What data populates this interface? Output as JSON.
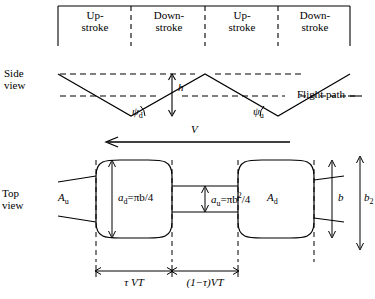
{
  "figure": {
    "phase_labels": [
      {
        "id": "up-stroke-1",
        "line1": "Up-",
        "line2": "stroke"
      },
      {
        "id": "down-stroke-1",
        "line1": "Down-",
        "line2": "stroke"
      },
      {
        "id": "up-stroke-2",
        "line1": "Up-",
        "line2": "stroke"
      },
      {
        "id": "down-stroke-2",
        "line1": "Down-",
        "line2": "stroke"
      }
    ],
    "side_view": {
      "label_line1": "Side",
      "label_line2": "view",
      "height_symbol": "h",
      "flight_path_label": "Flight path",
      "angle_down": "ψ",
      "angle_down_sub": "d",
      "angle_up": "ψ",
      "angle_up_sub": "u",
      "velocity_symbol": "V"
    },
    "top_view": {
      "label_line1": "Top",
      "label_line2": "view",
      "area_up_symbol": "A",
      "area_up_sub": "u",
      "area_down_symbol": "A",
      "area_down_sub": "d",
      "disc_area_down": "a",
      "disc_area_down_sub": "d",
      "disc_area_down_value": "=πb/4",
      "disc_area_up": "a",
      "disc_area_up_sub": "u",
      "disc_area_up_value": "=πb",
      "disc_area_up_sup": "2",
      "disc_area_up_value_tail": "/4",
      "span_symbol": "b",
      "span2_symbol": "b",
      "span2_sub": "2",
      "length_down": "τ VT",
      "length_up": "(1−τ)VT"
    },
    "colors": {
      "stroke": "#000000",
      "background": "#ffffff"
    }
  }
}
